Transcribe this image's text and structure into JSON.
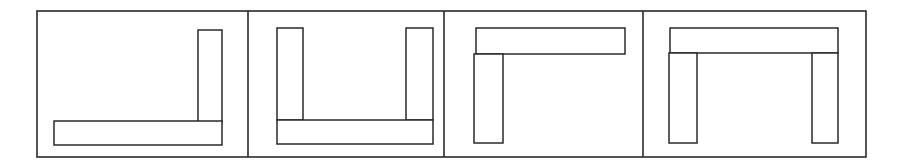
{
  "figure": {
    "stroke_color": "#2a2a2a",
    "background": "#ffffff",
    "outer_frame": {
      "x": 37,
      "y": 11,
      "w": 829,
      "h": 146
    },
    "dividers": [
      248,
      444,
      643
    ],
    "panels": [
      {
        "id": "panel-1",
        "shape": "J-shape",
        "bars": [
          {
            "name": "vertical-right",
            "x": 198,
            "y": 30,
            "w": 24,
            "h": 92
          },
          {
            "name": "horizontal-bottom",
            "x": 54,
            "y": 121,
            "w": 168,
            "h": 24
          }
        ]
      },
      {
        "id": "panel-2",
        "shape": "U-shape",
        "bars": [
          {
            "name": "vertical-left",
            "x": 277,
            "y": 28,
            "w": 26,
            "h": 92
          },
          {
            "name": "vertical-right",
            "x": 406,
            "y": 28,
            "w": 27,
            "h": 92
          },
          {
            "name": "horizontal-bottom",
            "x": 277,
            "y": 120,
            "w": 156,
            "h": 24
          }
        ]
      },
      {
        "id": "panel-3",
        "shape": "Gamma-shape",
        "bars": [
          {
            "name": "horizontal-top",
            "x": 476,
            "y": 28,
            "w": 149,
            "h": 26
          },
          {
            "name": "vertical-left",
            "x": 474,
            "y": 54,
            "w": 29,
            "h": 89
          }
        ]
      },
      {
        "id": "panel-4",
        "shape": "Pi-shape",
        "bars": [
          {
            "name": "horizontal-top",
            "x": 670,
            "y": 28,
            "w": 168,
            "h": 25
          },
          {
            "name": "vertical-left",
            "x": 669,
            "y": 53,
            "w": 28,
            "h": 90
          },
          {
            "name": "vertical-right",
            "x": 812,
            "y": 53,
            "w": 26,
            "h": 90
          }
        ]
      }
    ]
  }
}
